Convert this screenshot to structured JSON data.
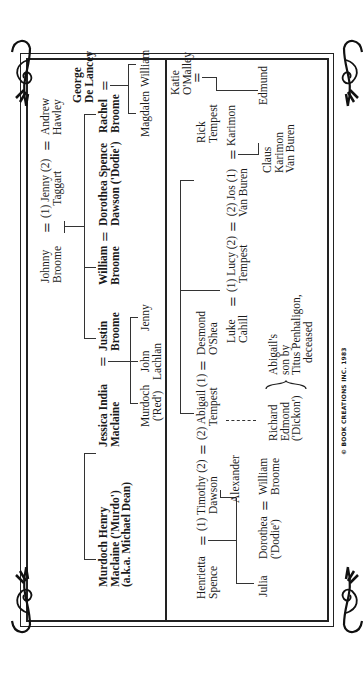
{
  "diagram": {
    "type": "family-tree",
    "orientation": "rotated-90-ccw",
    "colors": {
      "ink": "#1a1a1a",
      "background": "#ffffff"
    }
  },
  "top_tree": {
    "murdoch": {
      "line1": "Murdoch Henry",
      "line2": "Maclaine ('Murdo')",
      "line3": "(a.k.a. Michael Dean)"
    },
    "jessica": {
      "line1": "Jessica India",
      "line2": "Maclaine"
    },
    "justin": {
      "line1": "Justin",
      "line2": "Broome"
    },
    "johnny": {
      "line1": "Johnny",
      "line2": "Broome"
    },
    "jenny": {
      "line1": "(1) Jenny (2)",
      "line2": "Taggart"
    },
    "andrew": {
      "line1": "Andrew",
      "line2": "Hawley"
    },
    "william_broome": {
      "line1": "William",
      "line2": "Broome"
    },
    "dorothea_spence": {
      "line1": "Dorothea Spence",
      "line2": "Dawson ('Dodie')"
    },
    "rachel": {
      "line1": "Rachel",
      "line2": "Broome"
    },
    "george": {
      "line1": "George",
      "line2": "De Lancey"
    },
    "murdoch_red": {
      "line1": "Murdoch",
      "line2": "('Red')"
    },
    "john_lachlan": {
      "line1": "John",
      "line2": "Lachlan"
    },
    "jenny_child": {
      "line1": "Jenny"
    },
    "magdalen": {
      "line1": "Magdalen"
    },
    "william_child": {
      "line1": "William"
    }
  },
  "bottom_tree": {
    "henrietta": {
      "line1": "Henrietta",
      "line2": "Spence"
    },
    "timothy": {
      "line1": "(1) Timothy (2)",
      "line2": "Dawson"
    },
    "abigail": {
      "line1": "(2) Abigail (1)",
      "line2": "Tempest"
    },
    "desmond": {
      "line1": "Desmond",
      "line2": "O'Shea"
    },
    "rick": {
      "line1": "Rick",
      "line2": "Tempest"
    },
    "katie": {
      "line1": "Katie",
      "line2": "O'Malley"
    },
    "luke": {
      "line1": "Luke",
      "line2": "Cahill"
    },
    "lucy": {
      "line1": "(1) Lucy (2)",
      "line2": "Tempest"
    },
    "jos": {
      "line1": "(2) Jos (1)",
      "line2": "Van Buren"
    },
    "karimon": {
      "line1": "Karimon"
    },
    "edmund": {
      "line1": "Edmund"
    },
    "claus": {
      "line1": "Claus",
      "line2": "Karimon",
      "line3": "Van Buren"
    },
    "julia": {
      "line1": "Julia"
    },
    "dorothea": {
      "line1": "Dorothea",
      "line2": "('Dodie')"
    },
    "william_broome": {
      "line1": "William",
      "line2": "Broome"
    },
    "alexander": {
      "line1": "Alexander"
    },
    "richard": {
      "line1": "Richard",
      "line2": "Edmond",
      "line3": "('Dickon')"
    },
    "abigails_son_note": {
      "line1": "Abigail's",
      "line2": "son by",
      "line3": "Titus Penhaligon,",
      "line4": "deceased"
    }
  },
  "symbols": {
    "marriage": "="
  },
  "footer": {
    "copyright": "© BOOK CREATIONS INC. 1983"
  }
}
